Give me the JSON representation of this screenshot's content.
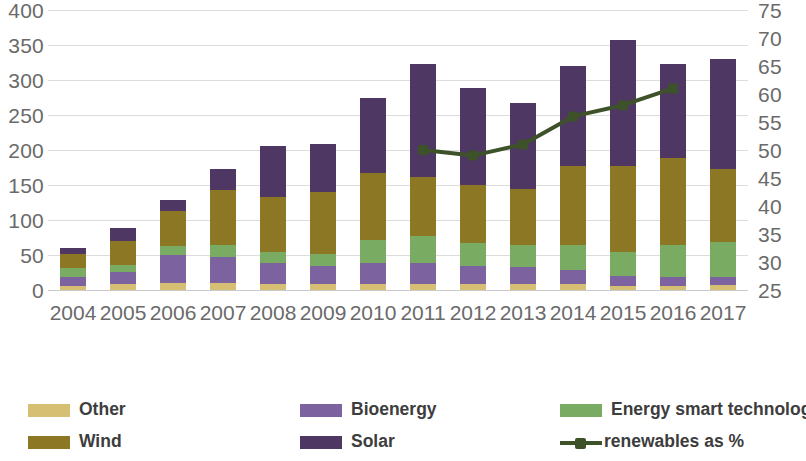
{
  "chart_data": {
    "type": "bar",
    "title": "",
    "subtitle": "",
    "xlabel": "",
    "ylabel": "",
    "y2label": "",
    "grid": true,
    "legend_position": "bottom",
    "categories": [
      "2004",
      "2005",
      "2006",
      "2007",
      "2008",
      "2009",
      "2010",
      "2011",
      "2012",
      "2013",
      "2014",
      "2015",
      "2016",
      "2017"
    ],
    "ylim": [
      0,
      400
    ],
    "yticks": [
      0,
      50,
      100,
      150,
      200,
      250,
      300,
      350,
      400
    ],
    "y2lim": [
      25,
      75
    ],
    "y2ticks": [
      25,
      30,
      35,
      40,
      45,
      50,
      55,
      60,
      65,
      70,
      75
    ],
    "stack_order_bottom_to_top": [
      "Other",
      "Bioenergy",
      "Energy smart technologies",
      "Wind",
      "Solar"
    ],
    "series": [
      {
        "name": "Other",
        "color": "#d6bf72",
        "axis": "left",
        "values": [
          6,
          9,
          10,
          10,
          9,
          9,
          8,
          9,
          9,
          9,
          8,
          6,
          6,
          7
        ]
      },
      {
        "name": "Bioenergy",
        "color": "#7c629e",
        "axis": "left",
        "values": [
          12,
          17,
          40,
          37,
          30,
          25,
          31,
          30,
          25,
          24,
          20,
          14,
          12,
          12
        ]
      },
      {
        "name": "Energy smart technologies",
        "color": "#7aab62",
        "axis": "left",
        "values": [
          13,
          10,
          13,
          17,
          15,
          18,
          32,
          38,
          33,
          31,
          37,
          35,
          47,
          50
        ]
      },
      {
        "name": "Wind",
        "color": "#8c7724",
        "axis": "left",
        "values": [
          21,
          34,
          50,
          79,
          79,
          88,
          96,
          85,
          83,
          80,
          112,
          122,
          124,
          104
        ]
      },
      {
        "name": "Solar",
        "color": "#4f3763",
        "axis": "left",
        "values": [
          8,
          18,
          15,
          30,
          73,
          68,
          108,
          161,
          139,
          123,
          143,
          180,
          134,
          157
        ]
      },
      {
        "name": "renewables as %",
        "color": "#3d5229",
        "axis": "right",
        "kind": "line",
        "values": [
          null,
          null,
          null,
          null,
          null,
          null,
          null,
          50,
          49,
          51,
          56,
          58,
          61,
          null
        ]
      }
    ],
    "totals": [
      60,
      88,
      128,
      173,
      206,
      208,
      275,
      323,
      289,
      267,
      320,
      357,
      323,
      330
    ]
  },
  "axes": {
    "left_ticks": [
      "400",
      "350",
      "300",
      "250",
      "200",
      "150",
      "100",
      "50",
      "0"
    ],
    "right_ticks": [
      "75",
      "70",
      "65",
      "60",
      "55",
      "50",
      "45",
      "40",
      "35",
      "30",
      "25"
    ],
    "x_ticks": [
      "2004",
      "2005",
      "2006",
      "2007",
      "2008",
      "2009",
      "2010",
      "2011",
      "2012",
      "2013",
      "2014",
      "2015",
      "2016",
      "2017"
    ]
  },
  "legend": {
    "items": [
      {
        "label": "Other",
        "color": "#d6bf72",
        "kind": "swatch"
      },
      {
        "label": "Bioenergy",
        "color": "#7c629e",
        "kind": "swatch"
      },
      {
        "label": "Energy smart technologies",
        "color": "#7aab62",
        "kind": "swatch"
      },
      {
        "label": "Wind",
        "color": "#8c7724",
        "kind": "swatch"
      },
      {
        "label": "Solar",
        "color": "#4f3763",
        "kind": "swatch"
      },
      {
        "label": "renewables as %",
        "color": "#3d5229",
        "kind": "line"
      }
    ]
  }
}
